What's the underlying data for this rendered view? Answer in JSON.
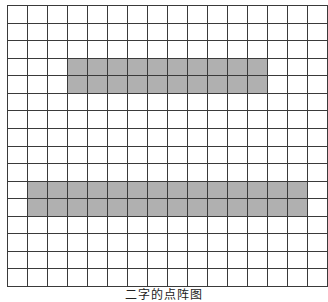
{
  "figure": {
    "caption": "二字的点阵图",
    "grid": {
      "rows": 16,
      "cols": 16,
      "line_color": "#3a3a3a",
      "fill_color": "#b0b0b0",
      "background_color": "#ffffff"
    },
    "filled_regions": [
      {
        "name": "top-stroke",
        "row_start": 3,
        "row_end": 4,
        "col_start": 3,
        "col_end": 12
      },
      {
        "name": "bottom-stroke",
        "row_start": 10,
        "row_end": 11,
        "col_start": 1,
        "col_end": 14
      }
    ]
  }
}
